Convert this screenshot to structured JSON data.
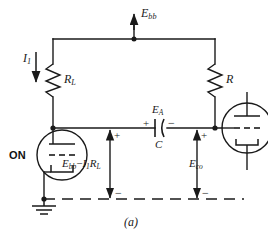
{
  "figure": {
    "caption": "(a)",
    "type": "vacuum-tube-circuit-schematic"
  },
  "colors": {
    "wire": "#1a1a1a",
    "background": "#ffffff",
    "text": "#1a1a1a"
  },
  "labels": {
    "supply": {
      "base": "E",
      "sub": "bb"
    },
    "current_left": {
      "base": "I",
      "sub": "1"
    },
    "resistor_load": {
      "base": "R",
      "sub": "L"
    },
    "resistor_right": {
      "base": "R",
      "sub": ""
    },
    "capacitor_voltage": {
      "base": "E",
      "sub": "A"
    },
    "capacitor": {
      "base": "C",
      "sub": ""
    },
    "plate_voltage": {
      "base": "E",
      "sub": "bb"
    },
    "plate_voltage_drop": {
      "base": "I",
      "sub": "1"
    },
    "plate_voltage_drop_r": {
      "base": "R",
      "sub": "L"
    },
    "plate_voltage_minus": "−",
    "cutoff_voltage": {
      "base": "E",
      "sub": "co"
    },
    "tube_on": "ON"
  },
  "polarity": {
    "cap_plus": "+",
    "cap_minus": "−",
    "left_branch_plus": "+",
    "left_branch_minus": "−",
    "right_branch_plus": "+",
    "right_branch_minus": "−"
  },
  "components": {
    "tube_left": {
      "name": "vacuum-tube-left",
      "state": "ON"
    },
    "tube_right": {
      "name": "vacuum-tube-right",
      "state": ""
    },
    "ground": {
      "name": "ground-symbol"
    }
  }
}
